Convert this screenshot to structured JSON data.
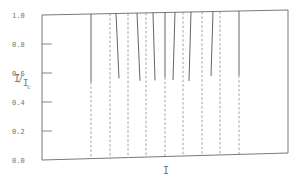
{
  "chart_data": {
    "type": "line",
    "title": "",
    "xlabel": "I",
    "ylabel": "I/Ic",
    "ylabel_main": "I",
    "ylabel_sub": "c",
    "ylim": [
      0.0,
      1.0
    ],
    "yticks": [
      "0.0",
      "0.2",
      "0.4",
      "0.6",
      "0.8",
      "1.0"
    ],
    "grid": false,
    "legend": null,
    "frame": {
      "left": 42,
      "right": 288,
      "top_left": 15,
      "top_right": 10,
      "bottom_left": 160,
      "bottom_right": 153
    },
    "series": [
      {
        "name": "solid-branches",
        "style": "solid",
        "segments": [
          {
            "x_top": 91,
            "x_bot": 91,
            "y_from": 1.0,
            "y_to": 0.53
          },
          {
            "x_top": 116,
            "x_bot": 119,
            "y_from": 1.0,
            "y_to": 0.55
          },
          {
            "x_top": 137,
            "x_bot": 140,
            "y_from": 1.0,
            "y_to": 0.53
          },
          {
            "x_top": 153,
            "x_bot": 155,
            "y_from": 1.0,
            "y_to": 0.53
          },
          {
            "x_top": 165,
            "x_bot": 165,
            "y_from": 1.0,
            "y_to": 0.55
          },
          {
            "x_top": 175,
            "x_bot": 173,
            "y_from": 1.0,
            "y_to": 0.53
          },
          {
            "x_top": 191,
            "x_bot": 189,
            "y_from": 1.0,
            "y_to": 0.52
          },
          {
            "x_top": 213,
            "x_bot": 211,
            "y_from": 1.0,
            "y_to": 0.55
          },
          {
            "x_top": 239,
            "x_bot": 239,
            "y_from": 1.0,
            "y_to": 0.55
          }
        ]
      },
      {
        "name": "dashed-branches",
        "style": "dashed",
        "segments": [
          {
            "x": 91,
            "y_from": 0.53,
            "y_to": 0.0
          },
          {
            "x": 110,
            "y_from": 1.0,
            "y_to": 0.0
          },
          {
            "x": 128,
            "y_from": 1.0,
            "y_to": 0.0
          },
          {
            "x": 146,
            "y_from": 1.0,
            "y_to": 0.0
          },
          {
            "x": 165,
            "y_from": 0.55,
            "y_to": 0.0
          },
          {
            "x": 183,
            "y_from": 1.0,
            "y_to": 0.0
          },
          {
            "x": 202,
            "y_from": 1.0,
            "y_to": 0.0
          },
          {
            "x": 220,
            "y_from": 1.0,
            "y_to": 0.0
          },
          {
            "x": 239,
            "y_from": 0.55,
            "y_to": 0.0
          }
        ]
      }
    ]
  },
  "colors": {
    "axis": "#6a6a6a",
    "solid": "#555555",
    "dashed": "#8a8a8a",
    "text": "#777777"
  }
}
